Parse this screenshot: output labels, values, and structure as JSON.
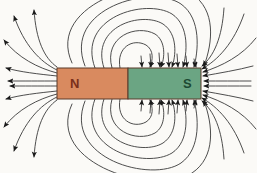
{
  "figure": {
    "background_color": "#fbfaf7",
    "width": 257,
    "height": 173
  },
  "magnet": {
    "x": 57,
    "y": 68,
    "width": 144,
    "height": 31,
    "border_color": "#5a3a2a",
    "north": {
      "label": "N",
      "fill_color": "#d98a5f",
      "text_color": "#7a2f1a",
      "x": 57,
      "width": 71,
      "label_x": 70,
      "label_y": 88
    },
    "south": {
      "label": "S",
      "fill_color": "#6ba583",
      "text_color": "#1d4a33",
      "x": 128,
      "width": 73,
      "label_x": 183,
      "label_y": 88
    }
  },
  "field": {
    "line_color": "#3a3a3a",
    "line_width": 0.9,
    "arrow_color": "#1a1a1a",
    "direction": "north-to-south",
    "loop_count_upper": 6,
    "loop_count_lower": 6,
    "radial_count_left": 10,
    "radial_count_right": 10
  },
  "chart_data": {
    "type": "diagram",
    "poles": [
      {
        "name": "N",
        "x": 92,
        "y": 83,
        "polarity": "north"
      },
      {
        "name": "S",
        "x": 166,
        "y": 83,
        "polarity": "south"
      }
    ],
    "loops_upper": [
      {
        "rx": 16,
        "ry": 14
      },
      {
        "rx": 27,
        "ry": 25
      },
      {
        "rx": 38,
        "ry": 36
      },
      {
        "rx": 49,
        "ry": 47
      },
      {
        "rx": 60,
        "ry": 58
      },
      {
        "rx": 71,
        "ry": 68
      }
    ],
    "loops_lower": [
      {
        "rx": 16,
        "ry": 14
      },
      {
        "rx": 27,
        "ry": 25
      },
      {
        "rx": 38,
        "ry": 36
      },
      {
        "rx": 49,
        "ry": 47
      },
      {
        "rx": 60,
        "ry": 58
      },
      {
        "rx": 71,
        "ry": 68
      }
    ]
  }
}
